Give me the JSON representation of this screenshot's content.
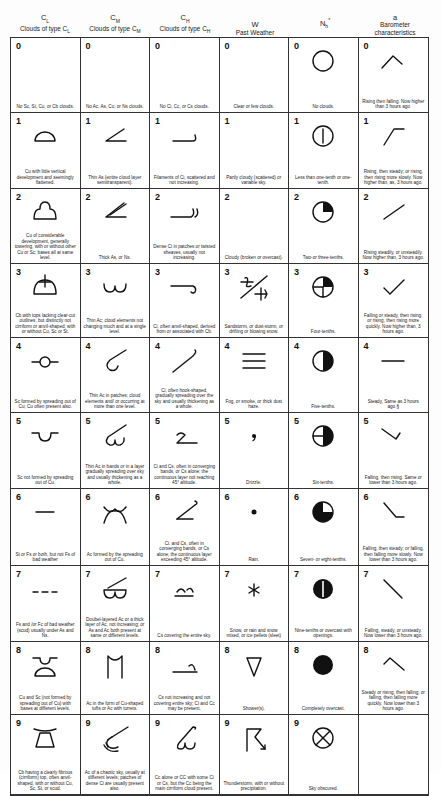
{
  "headers": [
    {
      "symbol": "C",
      "sub": "L",
      "title": "Clouds of type C",
      "title_sub": "L"
    },
    {
      "symbol": "C",
      "sub": "M",
      "title": "Clouds of type C",
      "title_sub": "M"
    },
    {
      "symbol": "C",
      "sub": "H",
      "title": "Clouds of type C",
      "title_sub": "H"
    },
    {
      "symbol": "W",
      "sub": "",
      "title": "Past Weather",
      "title_sub": ""
    },
    {
      "symbol": "N",
      "sub": "h",
      "title": "",
      "title_sub": "",
      "marker": "*"
    },
    {
      "symbol": "a",
      "sub": "",
      "title": "Barometer characteristics",
      "title_sub": ""
    }
  ],
  "rows": [
    {
      "code": "0",
      "cells": [
        {
          "code": "0",
          "icon": "none",
          "desc": "No Sc, St, Cu, or Cb clouds."
        },
        {
          "code": "0",
          "icon": "none",
          "desc": "No Ac, As, Cu, or Ns clouds."
        },
        {
          "code": "0",
          "icon": "none",
          "desc": "No Ci, Cc, or Cs clouds."
        },
        {
          "code": "0",
          "icon": "none",
          "desc": "Clear or few clouds."
        },
        {
          "code": "0",
          "icon": "circle-empty-icon",
          "desc": "No clouds."
        },
        {
          "code": "0",
          "icon": "rising-then-falling-icon",
          "desc": "Rising then falling. Now higher than 3 hours ago."
        }
      ]
    },
    {
      "code": "1",
      "cells": [
        {
          "code": "1",
          "icon": "cu-flattened-icon",
          "desc": "Cu with little vertical development and seemingly flattened."
        },
        {
          "code": "1",
          "icon": "thin-as-icon",
          "desc": "Thin As (entire cloud layer semitransparent)."
        },
        {
          "code": "1",
          "icon": "ci-filaments-icon",
          "desc": "Filaments of Ci, scattered and not increasing."
        },
        {
          "code": "1",
          "icon": "none",
          "desc": "Partly cloudy (scattered) or variable sky."
        },
        {
          "code": "1",
          "icon": "circle-one-tenth-icon",
          "desc": "Less than one-tenth or one-tenth."
        },
        {
          "code": "1",
          "icon": "rising-then-steady-icon",
          "desc": "Rising, then steady; or rising, then rising more slowly. Now higher than, as, 3 hours ago."
        }
      ]
    },
    {
      "code": "2",
      "cells": [
        {
          "code": "2",
          "icon": "cu-towering-icon",
          "desc": "Cu of considerable development, generally towering, with or without other Cu or Sc; bases all at same level."
        },
        {
          "code": "2",
          "icon": "thick-as-icon",
          "desc": "Thick As, or Ns."
        },
        {
          "code": "2",
          "icon": "dense-ci-icon",
          "desc": "Dense Ci in patches or twisted sheaves, usually not increasing."
        },
        {
          "code": "2",
          "icon": "none",
          "desc": "Cloudy (broken or overcast)."
        },
        {
          "code": "2",
          "icon": "circle-quarter-icon",
          "desc": "Two-or three-tenths."
        },
        {
          "code": "2",
          "icon": "rising-steadily-icon",
          "desc": "Rising steadily, or unsteadily. Now higher than, 3 hours ago."
        }
      ]
    },
    {
      "code": "3",
      "cells": [
        {
          "code": "3",
          "icon": "cb-no-anvil-icon",
          "desc": "Cb with tops lacking clear-cut outlines, but distinctly not cirriform or anvil-shaped; with or without Cu, Sc or St."
        },
        {
          "code": "3",
          "icon": "thin-ac-icon",
          "desc": "Thin Ac; cloud elements not changing much and at a single level."
        },
        {
          "code": "3",
          "icon": "ci-anvil-icon",
          "desc": "Ci, often anvil-shaped, derived from or associated with Cb."
        },
        {
          "code": "3",
          "icon": "sandstorm-icon",
          "desc": "Sandstorm, or dust-storm, or drifting or blowing snow."
        },
        {
          "code": "3",
          "icon": "circle-four-tenths-icon",
          "desc": "Four-tenths."
        },
        {
          "code": "3",
          "icon": "falling-then-rising-icon",
          "desc": "Falling or steady, then rising; or rising, then rising more quickly. Now higher than, 3 hours ago."
        }
      ]
    },
    {
      "code": "4",
      "cells": [
        {
          "code": "4",
          "icon": "sc-from-cu-icon",
          "desc": "Sc formed by spreading out of Cu; Cu often present also."
        },
        {
          "code": "4",
          "icon": "thin-ac-patches-icon",
          "desc": "Thin Ac in patches; cloud elements and/ or occurring at more than one level."
        },
        {
          "code": "4",
          "icon": "ci-hook-icon",
          "desc": "Ci, often hook-shaped, gradually spreading over the sky and usually thickening as a whole."
        },
        {
          "code": "4",
          "icon": "fog-icon",
          "desc": "Fog, or smoke, or thick dust haze."
        },
        {
          "code": "4",
          "icon": "circle-half-icon",
          "desc": "Five-tenths."
        },
        {
          "code": "4",
          "icon": "steady-icon",
          "desc": "Steady, Same as 3 hours ago.§"
        }
      ]
    },
    {
      "code": "5",
      "cells": [
        {
          "code": "5",
          "icon": "sc-not-from-cu-icon",
          "desc": "Sc not formed by spreading out of Cu."
        },
        {
          "code": "5",
          "icon": "thin-ac-bands-icon",
          "desc": "Thin Ac in bands or in a layer gradually spreading over sky and usually thickening as a whole."
        },
        {
          "code": "5",
          "icon": "ci-cs-bands-low-icon",
          "desc": "Ci and Cs, often in converging bands, or Cs alone; the continuous layer not reaching 45° altitude."
        },
        {
          "code": "5",
          "icon": "drizzle-icon",
          "desc": "Drizzle."
        },
        {
          "code": "5",
          "icon": "circle-six-tenths-icon",
          "desc": "Six-tenths."
        },
        {
          "code": "5",
          "icon": "falling-then-rising-lower-icon",
          "desc": "Falling, then rising. Same or lower than 3 hours ago."
        }
      ]
    },
    {
      "code": "6",
      "cells": [
        {
          "code": "6",
          "icon": "st-fs-icon",
          "desc": "St or Fs or both, but not Fs of bad weather"
        },
        {
          "code": "6",
          "icon": "ac-from-cu-icon",
          "desc": "Ac formed by the spreading out of Cu."
        },
        {
          "code": "6",
          "icon": "ci-cs-bands-high-icon",
          "desc": "Ci. and Cs, often in converging bands, or Cs alone; the continuous layer exceeding 45° altitude."
        },
        {
          "code": "6",
          "icon": "rain-icon",
          "desc": "Rain."
        },
        {
          "code": "6",
          "icon": "circle-seven-tenths-icon",
          "desc": "Seven- or eight-tenths."
        },
        {
          "code": "6",
          "icon": "falling-then-steady-icon",
          "desc": "Falling, then steady; or falling, then falling more slowly. Now lower than 3 hours ago."
        }
      ]
    },
    {
      "code": "7",
      "cells": [
        {
          "code": "7",
          "icon": "fs-fc-bad-weather-icon",
          "desc": "Fs and /or Fc of bad weather (scud) usually under As and Ns."
        },
        {
          "code": "7",
          "icon": "double-layered-ac-icon",
          "desc": "Doubel-layered Ac or a thick layer of Ac, not increasing; or As and Ac both present at same or different levels."
        },
        {
          "code": "7",
          "icon": "cs-entire-sky-icon",
          "desc": "Cs covering the entire sky."
        },
        {
          "code": "7",
          "icon": "snow-icon",
          "desc": "Snow, or rain and snow mixed, or ice pellets (sleet)"
        },
        {
          "code": "7",
          "icon": "circle-nine-tenths-icon",
          "desc": "Nine-tenths or overcast with openings."
        },
        {
          "code": "7",
          "icon": "falling-icon",
          "desc": "Falling, steady, or unsteady. Now lower than 3 hours ago."
        }
      ]
    },
    {
      "code": "8",
      "cells": [
        {
          "code": "8",
          "icon": "cu-sc-different-levels-icon",
          "desc": "Cu and Sc (not formed by spreading out of Cu) with bases at different levels."
        },
        {
          "code": "8",
          "icon": "ac-turrets-icon",
          "desc": "Ac in the form of Cu-shaped tufts or Ac with turrets."
        },
        {
          "code": "8",
          "icon": "cs-not-increasing-icon",
          "desc": "Cs not increasing and not covering entire sky; Ci and Cc may be present."
        },
        {
          "code": "8",
          "icon": "showers-icon",
          "desc": "Shower(s)."
        },
        {
          "code": "8",
          "icon": "circle-full-icon",
          "desc": "Completely overcast."
        },
        {
          "code": "8",
          "icon": "steady-then-falling-icon",
          "desc": "Steady or rising, then falling; or falling, then falling more quickly. Now lower than 3 hours ago."
        }
      ]
    },
    {
      "code": "9",
      "cells": [
        {
          "code": "9",
          "icon": "cb-anvil-icon",
          "desc": "Cb having a clearly fibrous (cirriform) top, often anvil-shaped, with or without Cu, Sc, St, or scud."
        },
        {
          "code": "9",
          "icon": "chaotic-ac-icon",
          "desc": "Ac of a chaotic sky, usually at different levels; patches of dense Ci are usually present also."
        },
        {
          "code": "9",
          "icon": "cc-alone-icon",
          "desc": "Cc alone or CC with some Ci or Cs, but the Cc being the main cirriform cloud present."
        },
        {
          "code": "9",
          "icon": "thunderstorm-icon",
          "desc": "Thunderstorm, with or without precipitation."
        },
        {
          "code": "9",
          "icon": "sky-obscured-icon",
          "desc": "Sky obscured."
        },
        {
          "code": "",
          "icon": "none",
          "desc": ""
        }
      ]
    }
  ]
}
